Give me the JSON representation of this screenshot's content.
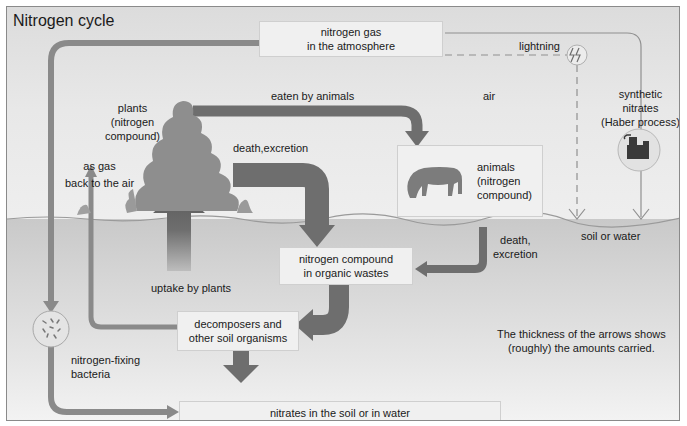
{
  "title": "Nitrogen cycle",
  "boxes": {
    "atmosphere": [
      "nitrogen gas",
      "in the atmosphere"
    ],
    "animals": [
      "animals",
      "(nitrogen",
      "compound)"
    ],
    "organic_wastes": [
      "nitrogen compound",
      "in organic wastes"
    ],
    "decomposers": [
      "decomposers and",
      "other soil organisms"
    ],
    "nitrates": "nitrates in the soil or in water"
  },
  "labels": {
    "lightning": "lightning",
    "air": "air",
    "eaten_by_animals": "eaten by animals",
    "plants": [
      "plants",
      "(nitrogen",
      "compound)"
    ],
    "death_excretion_plants": "death,excretion",
    "as_gas": [
      "as gas",
      "back to the air"
    ],
    "synthetic": [
      "synthetic",
      "nitrates",
      "(Haber process)"
    ],
    "soil_or_water": "soil or water",
    "death_excretion_animals": [
      "death,",
      "excretion"
    ],
    "uptake_by_plants": "uptake by plants",
    "nitrogen_fixing": [
      "nitrogen-fixing",
      "bacteria"
    ],
    "note": [
      "The thickness of the arrows shows",
      "(roughly) the amounts carried."
    ]
  },
  "icons": {
    "lightning": "lightning-bolt-icon",
    "haber": "factory-icon",
    "bacteria": "bacteria-icon",
    "horse": "horse-icon",
    "plant": "plant-bush-icon"
  },
  "colors": {
    "arrow": "#6e6e6e",
    "arrow_light": "#8c8c8c",
    "box": "#f0f0f0",
    "soil": "#cccccc",
    "sky": "#e6e6e6"
  }
}
